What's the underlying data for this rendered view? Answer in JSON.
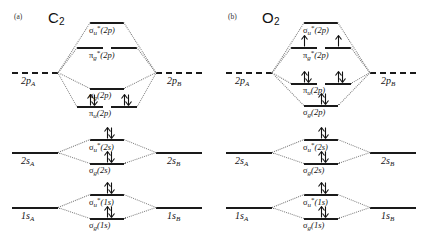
{
  "figure": {
    "type": "molecular-orbital-energy-level-diagram",
    "panel_count": 2
  },
  "panels": [
    {
      "tag": "(a)",
      "molecule_formula": "C",
      "molecule_subscript": "2",
      "molecule_plain": "C2",
      "atomic_left": [
        {
          "name": "2p_A",
          "symbol": "2p",
          "sub": "A",
          "style": "dashed"
        },
        {
          "name": "2s_A",
          "symbol": "2s",
          "sub": "A",
          "style": "solid"
        },
        {
          "name": "1s_A",
          "symbol": "1s",
          "sub": "A",
          "style": "solid"
        }
      ],
      "atomic_right": [
        {
          "name": "2p_B",
          "symbol": "2p",
          "sub": "B",
          "style": "dashed"
        },
        {
          "name": "2s_B",
          "symbol": "2s",
          "sub": "B",
          "style": "solid"
        },
        {
          "name": "1s_B",
          "symbol": "1s",
          "sub": "B",
          "style": "solid"
        }
      ],
      "molecular_orbitals": [
        {
          "name": "sigma-u-star-2p",
          "greek": "σ",
          "sub": "u",
          "star": true,
          "paren": "(2p)",
          "degeneracy": 1,
          "electrons": [
            0
          ]
        },
        {
          "name": "pi-g-star-2p",
          "greek": "π",
          "sub": "g",
          "star": true,
          "paren": "(2p)",
          "degeneracy": 2,
          "electrons": [
            0,
            0
          ]
        },
        {
          "name": "sigma-g-2p",
          "greek": "σ",
          "sub": "g",
          "star": false,
          "paren": "(2p)",
          "degeneracy": 1,
          "electrons": [
            0
          ]
        },
        {
          "name": "pi-u-2p",
          "greek": "π",
          "sub": "u",
          "star": false,
          "paren": "(2p)",
          "degeneracy": 2,
          "electrons": [
            2,
            2
          ]
        },
        {
          "name": "sigma-u-star-2s",
          "greek": "σ",
          "sub": "u",
          "star": true,
          "paren": "(2s)",
          "degeneracy": 1,
          "electrons": [
            2
          ]
        },
        {
          "name": "sigma-g-2s",
          "greek": "σ",
          "sub": "g",
          "star": false,
          "paren": "(2s)",
          "degeneracy": 1,
          "electrons": [
            2
          ]
        },
        {
          "name": "sigma-u-star-1s",
          "greek": "σ",
          "sub": "u",
          "star": true,
          "paren": "(1s)",
          "degeneracy": 1,
          "electrons": [
            2
          ]
        },
        {
          "name": "sigma-g-1s",
          "greek": "σ",
          "sub": "g",
          "star": false,
          "paren": "(1s)",
          "degeneracy": 1,
          "electrons": [
            2
          ]
        }
      ]
    },
    {
      "tag": "(b)",
      "molecule_formula": "O",
      "molecule_subscript": "2",
      "molecule_plain": "O2",
      "atomic_left": [
        {
          "name": "2p_A",
          "symbol": "2p",
          "sub": "A",
          "style": "dashed"
        },
        {
          "name": "2s_A",
          "symbol": "2s",
          "sub": "A",
          "style": "solid"
        },
        {
          "name": "1s_A",
          "symbol": "1s",
          "sub": "A",
          "style": "solid"
        }
      ],
      "atomic_right": [
        {
          "name": "2p_B",
          "symbol": "2p",
          "sub": "B",
          "style": "dashed"
        },
        {
          "name": "2s_B",
          "symbol": "2s",
          "sub": "B",
          "style": "solid"
        },
        {
          "name": "1s_B",
          "symbol": "1s",
          "sub": "B",
          "style": "solid"
        }
      ],
      "molecular_orbitals": [
        {
          "name": "sigma-u-star-2p",
          "greek": "σ",
          "sub": "u",
          "star": true,
          "paren": "(2p)",
          "degeneracy": 1,
          "electrons": [
            0
          ]
        },
        {
          "name": "pi-g-star-2p",
          "greek": "π",
          "sub": "g",
          "star": true,
          "paren": "(2p)",
          "degeneracy": 2,
          "electrons": [
            1,
            1
          ]
        },
        {
          "name": "pi-u-2p",
          "greek": "π",
          "sub": "u",
          "star": false,
          "paren": "(2p)",
          "degeneracy": 2,
          "electrons": [
            2,
            2
          ]
        },
        {
          "name": "sigma-g-2p",
          "greek": "σ",
          "sub": "g",
          "star": false,
          "paren": "(2p)",
          "degeneracy": 1,
          "electrons": [
            2
          ]
        },
        {
          "name": "sigma-u-star-2s",
          "greek": "σ",
          "sub": "u",
          "star": true,
          "paren": "(2s)",
          "degeneracy": 1,
          "electrons": [
            2
          ]
        },
        {
          "name": "sigma-g-2s",
          "greek": "σ",
          "sub": "g",
          "star": false,
          "paren": "(2s)",
          "degeneracy": 1,
          "electrons": [
            2
          ]
        },
        {
          "name": "sigma-u-star-1s",
          "greek": "σ",
          "sub": "u",
          "star": true,
          "paren": "(1s)",
          "degeneracy": 1,
          "electrons": [
            2
          ]
        },
        {
          "name": "sigma-g-1s",
          "greek": "σ",
          "sub": "g",
          "star": false,
          "paren": "(1s)",
          "degeneracy": 1,
          "electrons": [
            2
          ]
        }
      ]
    }
  ],
  "colors": {
    "level_line": "#1a1a1a",
    "tie_line": "#7a7a7a",
    "text": "#111111",
    "background": "#ffffff"
  }
}
